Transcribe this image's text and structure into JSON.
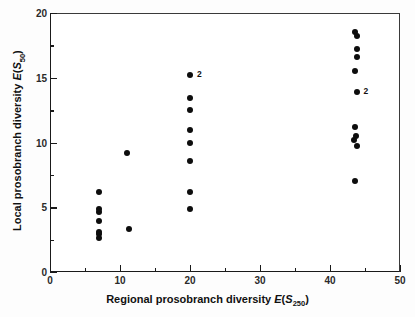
{
  "chart_data": {
    "type": "scatter",
    "title": "",
    "xlabel": "Regional prosobranch diversity E(S250)",
    "ylabel": "Local prosobranch diversity E(S50)",
    "xlim": [
      0,
      50
    ],
    "ylim": [
      0,
      20
    ],
    "xticks": [
      0,
      10,
      20,
      30,
      40,
      50
    ],
    "xticklabels": [
      "0",
      "10",
      "20",
      "30",
      "40",
      "50"
    ],
    "xminorticks": [
      5,
      15,
      25,
      35,
      45
    ],
    "yticks": [
      0,
      5,
      10,
      15,
      20
    ],
    "yticklabels": [
      "0",
      "5",
      "10",
      "15",
      "20"
    ],
    "yminorticks": [
      2.5,
      7.5,
      12.5,
      17.5
    ],
    "grid": false,
    "legend": false,
    "marker": "filled-circle",
    "marker_color": "#0d0d0d",
    "points": [
      {
        "x": 7.0,
        "y": 2.6
      },
      {
        "x": 7.0,
        "y": 2.9
      },
      {
        "x": 7.0,
        "y": 3.1
      },
      {
        "x": 7.0,
        "y": 3.9
      },
      {
        "x": 7.0,
        "y": 4.6
      },
      {
        "x": 7.0,
        "y": 4.9
      },
      {
        "x": 7.0,
        "y": 6.2
      },
      {
        "x": 11.3,
        "y": 3.3
      },
      {
        "x": 11.0,
        "y": 9.2
      },
      {
        "x": 20.0,
        "y": 4.9
      },
      {
        "x": 20.0,
        "y": 6.2
      },
      {
        "x": 20.0,
        "y": 8.6
      },
      {
        "x": 20.0,
        "y": 10.0
      },
      {
        "x": 20.0,
        "y": 11.0
      },
      {
        "x": 20.0,
        "y": 12.5
      },
      {
        "x": 20.0,
        "y": 13.4
      },
      {
        "x": 20.0,
        "y": 15.2,
        "label": "2"
      },
      {
        "x": 43.6,
        "y": 7.0
      },
      {
        "x": 43.8,
        "y": 9.7
      },
      {
        "x": 43.4,
        "y": 10.2
      },
      {
        "x": 43.7,
        "y": 10.5
      },
      {
        "x": 43.6,
        "y": 11.2
      },
      {
        "x": 43.8,
        "y": 13.9,
        "label": "2"
      },
      {
        "x": 43.5,
        "y": 15.5
      },
      {
        "x": 43.9,
        "y": 16.6
      },
      {
        "x": 43.9,
        "y": 17.2
      },
      {
        "x": 43.5,
        "y": 18.5
      },
      {
        "x": 43.9,
        "y": 18.2
      }
    ],
    "annotations": [
      {
        "text": "2",
        "x": 20.0,
        "y": 15.2,
        "note": "duplicate point count"
      },
      {
        "text": "2",
        "x": 43.8,
        "y": 13.9,
        "note": "duplicate point count"
      }
    ]
  },
  "axis": {
    "x_title_prefix": "Regional prosobranch diversity ",
    "x_title_var": "E",
    "x_title_open": "(",
    "x_title_s": "S",
    "x_title_sub": "250",
    "x_title_close": ")",
    "y_title_prefix": "Local prosobranch diversity ",
    "y_title_var": "E",
    "y_title_open": "(",
    "y_title_s": "S",
    "y_title_sub": "50",
    "y_title_close": ")"
  }
}
